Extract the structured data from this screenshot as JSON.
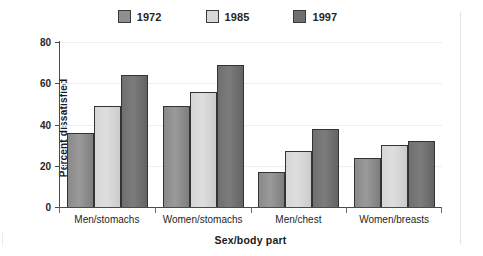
{
  "chart_data": {
    "type": "bar",
    "title": "",
    "xlabel": "Sex/body part",
    "ylabel": "Percent dissatisfied",
    "categories": [
      "Men/stomachs",
      "Women/stomachs",
      "Men/chest",
      "Women/breasts"
    ],
    "series": [
      {
        "name": "1972",
        "color": "#8f8f8f",
        "values": [
          36,
          49,
          17,
          24
        ]
      },
      {
        "name": "1985",
        "color": "#d8d8d8",
        "values": [
          49,
          56,
          27,
          30
        ]
      },
      {
        "name": "1997",
        "color": "#707070",
        "values": [
          64,
          69,
          38,
          32
        ]
      }
    ],
    "ylim": [
      0,
      80
    ],
    "yticks": [
      0,
      20,
      40,
      60,
      80
    ],
    "ytick_labels": [
      "0",
      "20",
      "40",
      "60",
      "80"
    ],
    "grid": true,
    "legend_position": "top-center"
  }
}
